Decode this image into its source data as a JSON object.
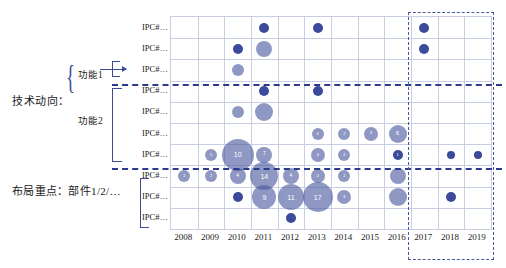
{
  "annotations": {
    "tech_trend_label": "技术动向：",
    "function1_label": "功能1",
    "function2_label": "功能2",
    "layout_focus_label": "布局重点：部件1/2/…"
  },
  "chart_data": {
    "type": "scatter",
    "title": "",
    "xlabel": "",
    "ylabel": "",
    "grid": true,
    "legend": false,
    "categories": [
      "2008",
      "2009",
      "2010",
      "2011",
      "2012",
      "2013",
      "2014",
      "2015",
      "2016",
      "2017",
      "2018",
      "2019"
    ],
    "y_categories": [
      "IPC#…",
      "IPC#…",
      "IPC#…",
      "IPC#…",
      "IPC#…",
      "IPC#…",
      "IPC#…",
      "IPC#…",
      "IPC#…",
      "IPC#…"
    ],
    "points": [
      {
        "x": "2011",
        "y": 0,
        "size": 5,
        "label": ""
      },
      {
        "x": "2013",
        "y": 0,
        "size": 5,
        "label": ""
      },
      {
        "x": "2017",
        "y": 0,
        "size": 5,
        "label": ""
      },
      {
        "x": "2010",
        "y": 1,
        "size": 5,
        "label": ""
      },
      {
        "x": "2011",
        "y": 1,
        "size": 8,
        "label": ""
      },
      {
        "x": "2017",
        "y": 1,
        "size": 5,
        "label": ""
      },
      {
        "x": "2010",
        "y": 2,
        "size": 6,
        "label": ""
      },
      {
        "x": "2011",
        "y": 3,
        "size": 5,
        "label": ""
      },
      {
        "x": "2013",
        "y": 3,
        "size": 5,
        "label": ""
      },
      {
        "x": "2011",
        "y": 4,
        "size": 9,
        "label": ""
      },
      {
        "x": "2010",
        "y": 4,
        "size": 6,
        "label": ""
      },
      {
        "x": "2013",
        "y": 5,
        "size": 6,
        "label": "4"
      },
      {
        "x": "2014",
        "y": 5,
        "size": 6,
        "label": "2"
      },
      {
        "x": "2015",
        "y": 5,
        "size": 7,
        "label": "3"
      },
      {
        "x": "2016",
        "y": 5,
        "size": 9,
        "label": "6"
      },
      {
        "x": "2009",
        "y": 6,
        "size": 6,
        "label": "5"
      },
      {
        "x": "2010",
        "y": 6,
        "size": 16,
        "label": "10"
      },
      {
        "x": "2011",
        "y": 6,
        "size": 8,
        "label": "7"
      },
      {
        "x": "2013",
        "y": 6,
        "size": 7,
        "label": "4"
      },
      {
        "x": "2014",
        "y": 6,
        "size": 6,
        "label": "2"
      },
      {
        "x": "2016",
        "y": 6,
        "size": 5,
        "label": "1"
      },
      {
        "x": "2018",
        "y": 6,
        "size": 4,
        "label": ""
      },
      {
        "x": "2019",
        "y": 6,
        "size": 4,
        "label": ""
      },
      {
        "x": "2008",
        "y": 7,
        "size": 6,
        "label": "2"
      },
      {
        "x": "2009",
        "y": 7,
        "size": 6,
        "label": "2"
      },
      {
        "x": "2010",
        "y": 7,
        "size": 8,
        "label": "4"
      },
      {
        "x": "2011",
        "y": 7,
        "size": 14,
        "label": "14"
      },
      {
        "x": "2012",
        "y": 7,
        "size": 8,
        "label": "4"
      },
      {
        "x": "2013",
        "y": 7,
        "size": 7,
        "label": "2"
      },
      {
        "x": "2014",
        "y": 7,
        "size": 6,
        "label": "2"
      },
      {
        "x": "2016",
        "y": 7,
        "size": 8,
        "label": ""
      },
      {
        "x": "2010",
        "y": 8,
        "size": 5,
        "label": ""
      },
      {
        "x": "2011",
        "y": 8,
        "size": 12,
        "label": "9"
      },
      {
        "x": "2012",
        "y": 8,
        "size": 13,
        "label": "11"
      },
      {
        "x": "2013",
        "y": 8,
        "size": 15,
        "label": "17"
      },
      {
        "x": "2014",
        "y": 8,
        "size": 7,
        "label": "3"
      },
      {
        "x": "2016",
        "y": 8,
        "size": 9,
        "label": ""
      },
      {
        "x": "2018",
        "y": 8,
        "size": 5,
        "label": ""
      },
      {
        "x": "2012",
        "y": 9,
        "size": 5,
        "label": ""
      }
    ],
    "focus_box": {
      "from": "2017",
      "to": "2019",
      "style": "dashed"
    },
    "separator_lines": [
      "after-row-2",
      "after-row-6"
    ]
  },
  "colors": {
    "bubble_fill": "#4a589e",
    "bubble_solid": "#3b4a9a",
    "grid": "#c8cfe4",
    "accent": "#2b3a8c",
    "focus_box": "#4a58a0"
  }
}
